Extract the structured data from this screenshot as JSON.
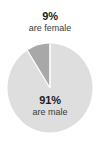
{
  "chart_data": {
    "type": "pie",
    "title": "",
    "subtitle": "",
    "xlabel": "",
    "ylabel": "",
    "legend_position": "none",
    "grid": false,
    "start_angle_deg": 90,
    "direction": "counterclockwise",
    "categories": [
      "are male",
      "are female"
    ],
    "values": [
      91,
      9
    ],
    "slices": [
      {
        "label": "are male",
        "value": 91,
        "value_label": "91%",
        "caption": "are male",
        "color": "#dedede",
        "label_placement": "inside"
      },
      {
        "label": "are female",
        "value": 9,
        "value_label": "9%",
        "caption": "are female",
        "color": "#a8a8a8",
        "label_placement": "outside-top"
      }
    ],
    "separator_color": "#ffffff",
    "background_color": "#ffffff",
    "text_color": "#1b1b1b",
    "caption_color": "#3a3a3a"
  },
  "annotations": {
    "top": {
      "value": "9%",
      "caption": "are female"
    },
    "inner": {
      "value": "91%",
      "caption": "are male"
    }
  }
}
